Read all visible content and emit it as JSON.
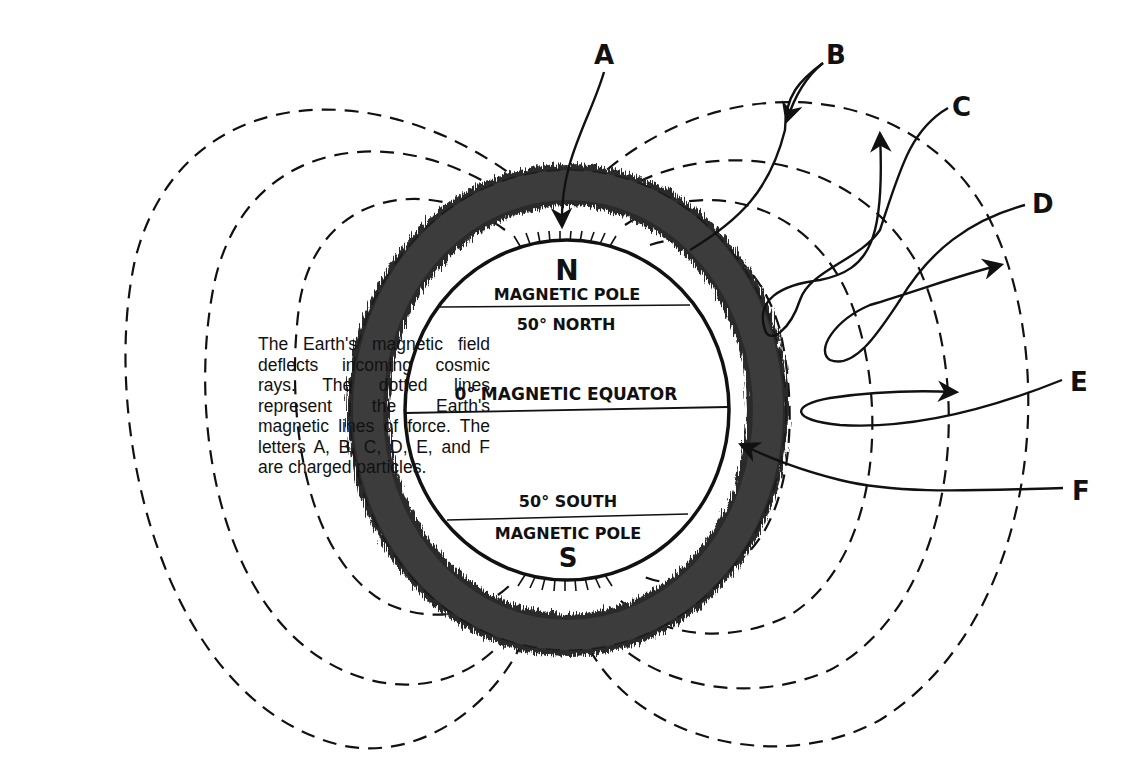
{
  "caption": "The Earth's magnetic field deflects incoming cosmic rays. The dotted lines represent the Earth's magnetic lines of force. The letters A, B, C, D, E, and F are charged particles.",
  "earth": {
    "north_letter": "N",
    "north_pole_label": "MAGNETIC POLE",
    "north_latitude": "50° NORTH",
    "equator_label": "0° MAGNETIC EQUATOR",
    "south_latitude": "50° SOUTH",
    "south_pole_label": "MAGNETIC POLE",
    "south_letter": "S"
  },
  "particles": {
    "a": "A",
    "b": "B",
    "c": "C",
    "d": "D",
    "e": "E",
    "f": "F"
  }
}
